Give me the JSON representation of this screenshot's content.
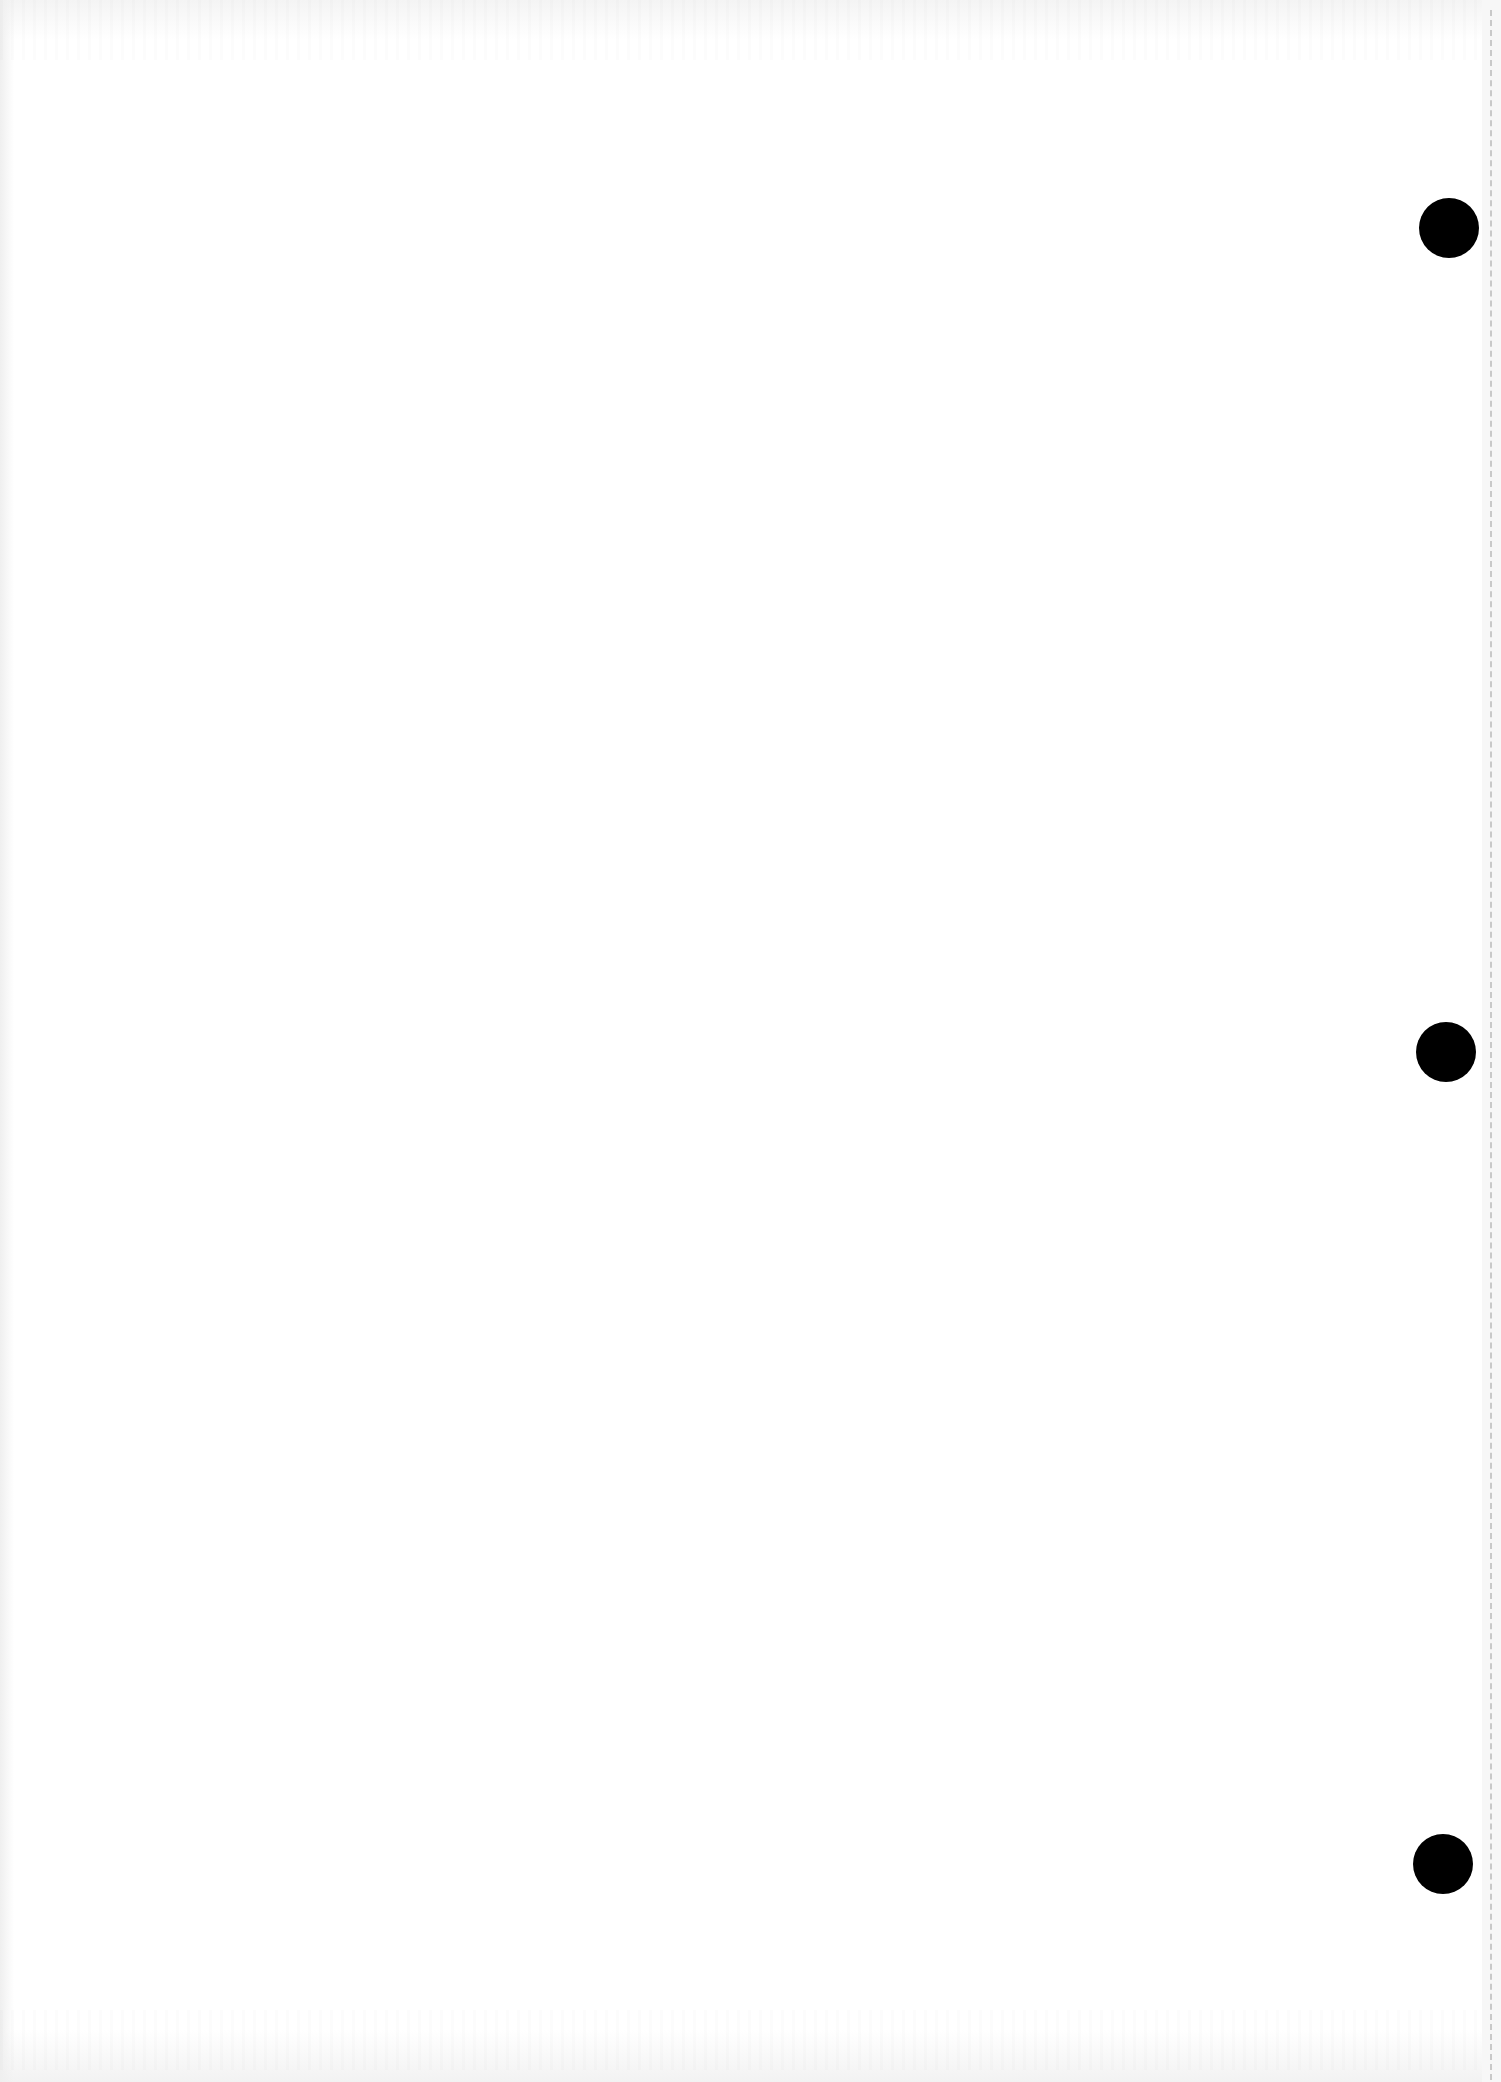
{
  "document": {
    "type": "blank-page-scan",
    "text": "",
    "background_color": "#ffffff"
  },
  "punch_holes": [
    {
      "name": "top-hole",
      "cx": 1449,
      "cy": 228,
      "r": 30,
      "color": "#000000"
    },
    {
      "name": "middle-hole",
      "cx": 1446,
      "cy": 1052,
      "r": 30,
      "color": "#000000"
    },
    {
      "name": "bottom-hole",
      "cx": 1443,
      "cy": 1864,
      "r": 30,
      "color": "#000000"
    }
  ],
  "perforation": {
    "x": 1490,
    "style": "dashed",
    "color": "#c9c9c9"
  }
}
